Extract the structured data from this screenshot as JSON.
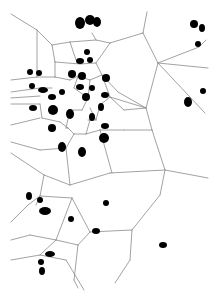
{
  "diagram": {
    "type": "voronoi-tessellation",
    "background": "#ffffff",
    "edge_color": "#8a8a8a",
    "cell_color": "#000000",
    "width": 219,
    "height": 297,
    "edges": [
      [
        11,
        14,
        37,
        30
      ],
      [
        37,
        30,
        52,
        45
      ],
      [
        52,
        45,
        70,
        42
      ],
      [
        70,
        42,
        96,
        40
      ],
      [
        96,
        40,
        110,
        43
      ],
      [
        110,
        43,
        143,
        33
      ],
      [
        143,
        33,
        147,
        12
      ],
      [
        37,
        30,
        37,
        77
      ],
      [
        52,
        45,
        55,
        62
      ],
      [
        55,
        62,
        55,
        77
      ],
      [
        55,
        62,
        80,
        64
      ],
      [
        80,
        64,
        96,
        63
      ],
      [
        96,
        63,
        110,
        43
      ],
      [
        96,
        63,
        102,
        75
      ],
      [
        70,
        42,
        76,
        60
      ],
      [
        96,
        40,
        92,
        33
      ],
      [
        143,
        33,
        158,
        63
      ],
      [
        158,
        63,
        208,
        68
      ],
      [
        158,
        63,
        199,
        47
      ],
      [
        199,
        47,
        206,
        40
      ],
      [
        158,
        63,
        205,
        113
      ],
      [
        158,
        63,
        146,
        108
      ],
      [
        146,
        108,
        110,
        97
      ],
      [
        146,
        108,
        152,
        130
      ],
      [
        152,
        130,
        165,
        170
      ],
      [
        165,
        170,
        208,
        178
      ],
      [
        165,
        170,
        110,
        173
      ],
      [
        165,
        170,
        160,
        195
      ],
      [
        11,
        80,
        37,
        77
      ],
      [
        37,
        77,
        55,
        77
      ],
      [
        55,
        77,
        70,
        80
      ],
      [
        11,
        92,
        40,
        88
      ],
      [
        40,
        88,
        52,
        88
      ],
      [
        11,
        98,
        40,
        96
      ],
      [
        11,
        104,
        40,
        104
      ],
      [
        40,
        104,
        42,
        118
      ],
      [
        42,
        118,
        60,
        122
      ],
      [
        60,
        122,
        68,
        128
      ],
      [
        70,
        80,
        78,
        76
      ],
      [
        78,
        76,
        90,
        80
      ],
      [
        90,
        80,
        102,
        75
      ],
      [
        102,
        75,
        110,
        97
      ],
      [
        102,
        75,
        118,
        92
      ],
      [
        118,
        92,
        146,
        108
      ],
      [
        110,
        97,
        124,
        110
      ],
      [
        124,
        110,
        146,
        108
      ],
      [
        110,
        97,
        100,
        105
      ],
      [
        100,
        105,
        96,
        120
      ],
      [
        96,
        120,
        88,
        120
      ],
      [
        78,
        76,
        74,
        88
      ],
      [
        74,
        88,
        88,
        98
      ],
      [
        88,
        98,
        90,
        80
      ],
      [
        88,
        98,
        82,
        110
      ],
      [
        82,
        110,
        70,
        110
      ],
      [
        70,
        110,
        66,
        128
      ],
      [
        66,
        128,
        68,
        128
      ],
      [
        90,
        108,
        96,
        120
      ],
      [
        90,
        120,
        86,
        134
      ],
      [
        86,
        134,
        74,
        134
      ],
      [
        74,
        134,
        68,
        128
      ],
      [
        86,
        134,
        100,
        130
      ],
      [
        100,
        130,
        124,
        130
      ],
      [
        124,
        130,
        152,
        130
      ],
      [
        100,
        130,
        112,
        173
      ],
      [
        74,
        134,
        66,
        148
      ],
      [
        66,
        148,
        40,
        150
      ],
      [
        40,
        150,
        11,
        142
      ],
      [
        11,
        125,
        40,
        118
      ],
      [
        66,
        148,
        70,
        185
      ],
      [
        70,
        185,
        110,
        173
      ],
      [
        70,
        185,
        44,
        175
      ],
      [
        44,
        175,
        11,
        153
      ],
      [
        44,
        175,
        40,
        196
      ],
      [
        40,
        196,
        36,
        205
      ],
      [
        40,
        196,
        72,
        198
      ],
      [
        72,
        198,
        90,
        232
      ],
      [
        90,
        232,
        132,
        230
      ],
      [
        132,
        230,
        160,
        195
      ],
      [
        132,
        230,
        130,
        260
      ],
      [
        130,
        260,
        115,
        283
      ],
      [
        72,
        198,
        56,
        240
      ],
      [
        56,
        240,
        78,
        245
      ],
      [
        78,
        245,
        90,
        232
      ],
      [
        78,
        245,
        74,
        280
      ],
      [
        74,
        280,
        78,
        288
      ],
      [
        56,
        240,
        30,
        235
      ],
      [
        30,
        235,
        11,
        240
      ],
      [
        11,
        260,
        40,
        255
      ],
      [
        40,
        255,
        56,
        240
      ],
      [
        40,
        255,
        66,
        260
      ],
      [
        66,
        260,
        84,
        290
      ],
      [
        11,
        222,
        28,
        205
      ],
      [
        28,
        205,
        40,
        196
      ]
    ],
    "cells": [
      {
        "cx": 80,
        "cy": 23,
        "rx": 5,
        "ry": 6
      },
      {
        "cx": 90,
        "cy": 20,
        "rx": 5,
        "ry": 5
      },
      {
        "cx": 97,
        "cy": 22,
        "rx": 4,
        "ry": 5
      },
      {
        "cx": 87,
        "cy": 52,
        "rx": 3,
        "ry": 3
      },
      {
        "cx": 80,
        "cy": 61,
        "rx": 4,
        "ry": 3
      },
      {
        "cx": 90,
        "cy": 60,
        "rx": 3,
        "ry": 3
      },
      {
        "cx": 30,
        "cy": 72,
        "rx": 3,
        "ry": 3
      },
      {
        "cx": 39,
        "cy": 73,
        "rx": 3,
        "ry": 3
      },
      {
        "cx": 72,
        "cy": 74,
        "rx": 4,
        "ry": 4
      },
      {
        "cx": 82,
        "cy": 76,
        "rx": 4,
        "ry": 4
      },
      {
        "cx": 106,
        "cy": 78,
        "rx": 4,
        "ry": 4
      },
      {
        "cx": 32,
        "cy": 86,
        "rx": 3,
        "ry": 3
      },
      {
        "cx": 43,
        "cy": 90,
        "rx": 5,
        "ry": 3
      },
      {
        "cx": 62,
        "cy": 92,
        "rx": 3,
        "ry": 3
      },
      {
        "cx": 52,
        "cy": 97,
        "rx": 4,
        "ry": 3
      },
      {
        "cx": 80,
        "cy": 87,
        "rx": 4,
        "ry": 3
      },
      {
        "cx": 92,
        "cy": 88,
        "rx": 3,
        "ry": 3
      },
      {
        "cx": 86,
        "cy": 97,
        "rx": 4,
        "ry": 4
      },
      {
        "cx": 105,
        "cy": 95,
        "rx": 4,
        "ry": 3
      },
      {
        "cx": 33,
        "cy": 108,
        "rx": 4,
        "ry": 3
      },
      {
        "cx": 53,
        "cy": 110,
        "rx": 5,
        "ry": 5
      },
      {
        "cx": 70,
        "cy": 114,
        "rx": 4,
        "ry": 5
      },
      {
        "cx": 92,
        "cy": 117,
        "rx": 3,
        "ry": 4
      },
      {
        "cx": 101,
        "cy": 107,
        "rx": 3,
        "ry": 4
      },
      {
        "cx": 52,
        "cy": 128,
        "rx": 4,
        "ry": 4
      },
      {
        "cx": 105,
        "cy": 126,
        "rx": 4,
        "ry": 3
      },
      {
        "cx": 62,
        "cy": 147,
        "rx": 4,
        "ry": 5
      },
      {
        "cx": 82,
        "cy": 152,
        "rx": 4,
        "ry": 5
      },
      {
        "cx": 104,
        "cy": 138,
        "rx": 5,
        "ry": 5
      },
      {
        "cx": 194,
        "cy": 24,
        "rx": 4,
        "ry": 4
      },
      {
        "cx": 202,
        "cy": 28,
        "rx": 3,
        "ry": 4
      },
      {
        "cx": 198,
        "cy": 44,
        "rx": 3,
        "ry": 3
      },
      {
        "cx": 203,
        "cy": 91,
        "rx": 3,
        "ry": 3
      },
      {
        "cx": 188,
        "cy": 102,
        "rx": 4,
        "ry": 5
      },
      {
        "cx": 29,
        "cy": 196,
        "rx": 3,
        "ry": 4
      },
      {
        "cx": 40,
        "cy": 200,
        "rx": 3,
        "ry": 3
      },
      {
        "cx": 45,
        "cy": 211,
        "rx": 6,
        "ry": 4
      },
      {
        "cx": 71,
        "cy": 219,
        "rx": 3,
        "ry": 3
      },
      {
        "cx": 106,
        "cy": 203,
        "rx": 3,
        "ry": 3
      },
      {
        "cx": 96,
        "cy": 231,
        "rx": 4,
        "ry": 3
      },
      {
        "cx": 163,
        "cy": 245,
        "rx": 4,
        "ry": 3
      },
      {
        "cx": 50,
        "cy": 254,
        "rx": 5,
        "ry": 3
      },
      {
        "cx": 41,
        "cy": 262,
        "rx": 3,
        "ry": 3
      },
      {
        "cx": 42,
        "cy": 271,
        "rx": 3,
        "ry": 4
      }
    ]
  }
}
